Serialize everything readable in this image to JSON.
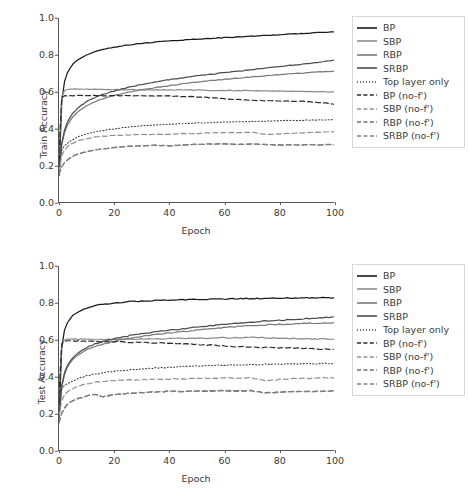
{
  "figure": {
    "xlabel": "Epoch",
    "xticks": [
      "0",
      "20",
      "40",
      "60",
      "80",
      "100"
    ],
    "yticks": [
      "0.0",
      "0.2",
      "0.4",
      "0.6",
      "0.8",
      "1.0"
    ]
  },
  "colors": {
    "bp": "#1a1a1a",
    "sbp": "#8c8c8c",
    "rbp": "#7a7a7a",
    "srbp": "#4d4d4d",
    "top_layer_only": "#3d3d3d",
    "bp_nof": "#2b2b2b",
    "sbp_nof": "#909090",
    "rbp_nof": "#6e6e6e",
    "srbp_nof": "#808080",
    "axis": "#555555",
    "text": "#3b3b3b",
    "legend_border": "#d8d8d8",
    "background": "#ffffff"
  },
  "legend": {
    "items": [
      {
        "label": "BP",
        "style": "solid",
        "color_key": "bp"
      },
      {
        "label": "SBP",
        "style": "solid",
        "color_key": "sbp"
      },
      {
        "label": "RBP",
        "style": "solid",
        "color_key": "rbp"
      },
      {
        "label": "SRBP",
        "style": "solid",
        "color_key": "srbp"
      },
      {
        "label": "Top layer only",
        "style": "dotted",
        "color_key": "top_layer_only"
      },
      {
        "label": "BP (no-f')",
        "style": "dashed",
        "color_key": "bp_nof"
      },
      {
        "label": "SBP (no-f')",
        "style": "dashed",
        "color_key": "sbp_nof"
      },
      {
        "label": "RBP (no-f')",
        "style": "dashed",
        "color_key": "rbp_nof"
      },
      {
        "label": "SRBP (no-f')",
        "style": "dashed",
        "color_key": "srbp_nof"
      }
    ]
  },
  "chart_data": [
    {
      "type": "line",
      "panel": "train",
      "title": "",
      "xlabel": "Epoch",
      "ylabel": "Train Accuracy",
      "xlim": [
        0,
        100
      ],
      "ylim": [
        0.0,
        1.0
      ],
      "grid": false,
      "legend_position": "right",
      "x": [
        0,
        1,
        2,
        3,
        4,
        5,
        7,
        10,
        13,
        16,
        20,
        25,
        30,
        35,
        40,
        45,
        50,
        55,
        60,
        65,
        70,
        75,
        80,
        85,
        90,
        95,
        100
      ],
      "series": [
        {
          "name": "BP",
          "style": "solid",
          "color_key": "bp",
          "values": [
            0.145,
            0.545,
            0.655,
            0.7,
            0.728,
            0.748,
            0.775,
            0.8,
            0.817,
            0.829,
            0.841,
            0.853,
            0.862,
            0.869,
            0.875,
            0.88,
            0.885,
            0.889,
            0.893,
            0.897,
            0.901,
            0.905,
            0.909,
            0.913,
            0.917,
            0.921,
            0.925
          ]
        },
        {
          "name": "SBP",
          "style": "solid",
          "color_key": "sbp",
          "values": [
            0.255,
            0.575,
            0.605,
            0.612,
            0.614,
            0.614,
            0.613,
            0.613,
            0.612,
            0.612,
            0.611,
            0.611,
            0.61,
            0.61,
            0.609,
            0.609,
            0.608,
            0.607,
            0.607,
            0.606,
            0.605,
            0.604,
            0.603,
            0.602,
            0.601,
            0.6,
            0.598
          ]
        },
        {
          "name": "RBP",
          "style": "solid",
          "color_key": "rbp",
          "values": [
            0.145,
            0.31,
            0.375,
            0.415,
            0.442,
            0.462,
            0.492,
            0.523,
            0.545,
            0.561,
            0.578,
            0.596,
            0.61,
            0.622,
            0.632,
            0.642,
            0.651,
            0.659,
            0.666,
            0.673,
            0.68,
            0.686,
            0.692,
            0.697,
            0.702,
            0.707,
            0.711
          ]
        },
        {
          "name": "SRBP",
          "style": "solid",
          "color_key": "srbp",
          "values": [
            0.145,
            0.32,
            0.39,
            0.432,
            0.46,
            0.482,
            0.513,
            0.545,
            0.568,
            0.585,
            0.603,
            0.623,
            0.639,
            0.652,
            0.664,
            0.675,
            0.685,
            0.694,
            0.703,
            0.711,
            0.719,
            0.727,
            0.735,
            0.744,
            0.752,
            0.761,
            0.77
          ]
        },
        {
          "name": "Top layer only",
          "style": "dotted",
          "color_key": "top_layer_only",
          "values": [
            0.23,
            0.281,
            0.305,
            0.32,
            0.331,
            0.34,
            0.354,
            0.37,
            0.381,
            0.389,
            0.398,
            0.407,
            0.414,
            0.419,
            0.423,
            0.426,
            0.429,
            0.432,
            0.434,
            0.436,
            0.438,
            0.44,
            0.442,
            0.443,
            0.445,
            0.446,
            0.448
          ]
        },
        {
          "name": "BP (no-f')",
          "style": "dashed",
          "color_key": "bp_nof",
          "values": [
            0.268,
            0.565,
            0.577,
            0.578,
            0.578,
            0.578,
            0.578,
            0.578,
            0.578,
            0.578,
            0.578,
            0.578,
            0.577,
            0.577,
            0.576,
            0.574,
            0.571,
            0.567,
            0.562,
            0.557,
            0.553,
            0.551,
            0.549,
            0.548,
            0.546,
            0.54,
            0.533
          ]
        },
        {
          "name": "SBP (no-f')",
          "style": "dashed",
          "color_key": "sbp_nof",
          "values": [
            0.165,
            0.25,
            0.281,
            0.299,
            0.311,
            0.32,
            0.333,
            0.345,
            0.352,
            0.357,
            0.361,
            0.365,
            0.367,
            0.368,
            0.369,
            0.371,
            0.373,
            0.375,
            0.377,
            0.378,
            0.38,
            0.366,
            0.37,
            0.374,
            0.377,
            0.379,
            0.381
          ]
        },
        {
          "name": "RBP (no-f')",
          "style": "dashed",
          "color_key": "rbp_nof",
          "values": [
            0.15,
            0.19,
            0.213,
            0.228,
            0.239,
            0.248,
            0.261,
            0.274,
            0.283,
            0.289,
            0.296,
            0.302,
            0.306,
            0.309,
            0.305,
            0.31,
            0.313,
            0.315,
            0.316,
            0.313,
            0.315,
            0.312,
            0.31,
            0.311,
            0.311,
            0.311,
            0.312
          ]
        },
        {
          "name": "SRBP (no-f')",
          "style": "dashed",
          "color_key": "srbp_nof",
          "values": [
            0.15,
            0.19,
            0.213,
            0.228,
            0.239,
            0.248,
            0.261,
            0.274,
            0.283,
            0.289,
            0.296,
            0.302,
            0.306,
            0.309,
            0.305,
            0.31,
            0.313,
            0.315,
            0.316,
            0.313,
            0.315,
            0.312,
            0.31,
            0.311,
            0.311,
            0.311,
            0.312
          ]
        }
      ]
    },
    {
      "type": "line",
      "panel": "test",
      "title": "",
      "xlabel": "Epoch",
      "ylabel": "Test Accuracy",
      "xlim": [
        0,
        100
      ],
      "ylim": [
        0.0,
        1.0
      ],
      "grid": false,
      "legend_position": "right",
      "x": [
        0,
        1,
        2,
        3,
        4,
        5,
        7,
        10,
        13,
        16,
        20,
        25,
        30,
        35,
        40,
        45,
        50,
        55,
        60,
        65,
        70,
        75,
        80,
        85,
        90,
        95,
        100
      ],
      "series": [
        {
          "name": "BP",
          "style": "solid",
          "color_key": "bp",
          "values": [
            0.175,
            0.56,
            0.65,
            0.688,
            0.712,
            0.73,
            0.752,
            0.772,
            0.784,
            0.791,
            0.798,
            0.805,
            0.81,
            0.812,
            0.814,
            0.816,
            0.818,
            0.819,
            0.821,
            0.822,
            0.824,
            0.824,
            0.825,
            0.826,
            0.827,
            0.828,
            0.828
          ]
        },
        {
          "name": "SBP",
          "style": "solid",
          "color_key": "sbp",
          "values": [
            0.3,
            0.58,
            0.598,
            0.602,
            0.603,
            0.603,
            0.602,
            0.602,
            0.601,
            0.601,
            0.601,
            0.602,
            0.603,
            0.604,
            0.605,
            0.606,
            0.607,
            0.608,
            0.61,
            0.611,
            0.612,
            0.61,
            0.608,
            0.606,
            0.604,
            0.603,
            0.604
          ]
        },
        {
          "name": "RBP",
          "style": "solid",
          "color_key": "rbp",
          "values": [
            0.175,
            0.345,
            0.41,
            0.448,
            0.472,
            0.49,
            0.516,
            0.543,
            0.562,
            0.576,
            0.59,
            0.605,
            0.617,
            0.627,
            0.636,
            0.644,
            0.652,
            0.659,
            0.666,
            0.671,
            0.676,
            0.68,
            0.683,
            0.686,
            0.688,
            0.69,
            0.692
          ]
        },
        {
          "name": "SRBP",
          "style": "solid",
          "color_key": "srbp",
          "values": [
            0.175,
            0.352,
            0.42,
            0.458,
            0.483,
            0.502,
            0.528,
            0.556,
            0.576,
            0.59,
            0.604,
            0.62,
            0.632,
            0.642,
            0.651,
            0.659,
            0.667,
            0.675,
            0.682,
            0.689,
            0.695,
            0.7,
            0.705,
            0.71,
            0.714,
            0.718,
            0.722
          ]
        },
        {
          "name": "Top layer only",
          "style": "dotted",
          "color_key": "top_layer_only",
          "values": [
            0.298,
            0.33,
            0.348,
            0.36,
            0.369,
            0.376,
            0.388,
            0.402,
            0.412,
            0.419,
            0.427,
            0.435,
            0.441,
            0.446,
            0.45,
            0.453,
            0.456,
            0.459,
            0.461,
            0.463,
            0.464,
            0.466,
            0.467,
            0.468,
            0.469,
            0.47,
            0.471
          ]
        },
        {
          "name": "BP (no-f')",
          "style": "dashed",
          "color_key": "bp_nof",
          "values": [
            0.3,
            0.578,
            0.592,
            0.594,
            0.594,
            0.593,
            0.592,
            0.591,
            0.59,
            0.589,
            0.588,
            0.586,
            0.584,
            0.582,
            0.58,
            0.577,
            0.574,
            0.57,
            0.566,
            0.562,
            0.559,
            0.557,
            0.556,
            0.554,
            0.552,
            0.548,
            0.545
          ]
        },
        {
          "name": "SBP (no-f')",
          "style": "dashed",
          "color_key": "sbp_nof",
          "values": [
            0.185,
            0.27,
            0.298,
            0.314,
            0.325,
            0.334,
            0.347,
            0.36,
            0.368,
            0.372,
            0.376,
            0.38,
            0.382,
            0.384,
            0.385,
            0.387,
            0.389,
            0.39,
            0.392,
            0.39,
            0.392,
            0.378,
            0.383,
            0.387,
            0.389,
            0.39,
            0.392
          ]
        },
        {
          "name": "RBP (no-f')",
          "style": "dashed",
          "color_key": "rbp_nof",
          "values": [
            0.148,
            0.2,
            0.228,
            0.246,
            0.258,
            0.267,
            0.281,
            0.294,
            0.303,
            0.29,
            0.3,
            0.308,
            0.313,
            0.316,
            0.318,
            0.319,
            0.32,
            0.321,
            0.322,
            0.321,
            0.322,
            0.31,
            0.314,
            0.317,
            0.318,
            0.319,
            0.32
          ]
        },
        {
          "name": "SRBP (no-f')",
          "style": "dashed",
          "color_key": "srbp_nof",
          "values": [
            0.148,
            0.2,
            0.228,
            0.246,
            0.258,
            0.267,
            0.281,
            0.294,
            0.303,
            0.29,
            0.3,
            0.308,
            0.313,
            0.316,
            0.318,
            0.319,
            0.32,
            0.321,
            0.322,
            0.321,
            0.322,
            0.31,
            0.314,
            0.317,
            0.318,
            0.319,
            0.32
          ]
        }
      ]
    }
  ]
}
